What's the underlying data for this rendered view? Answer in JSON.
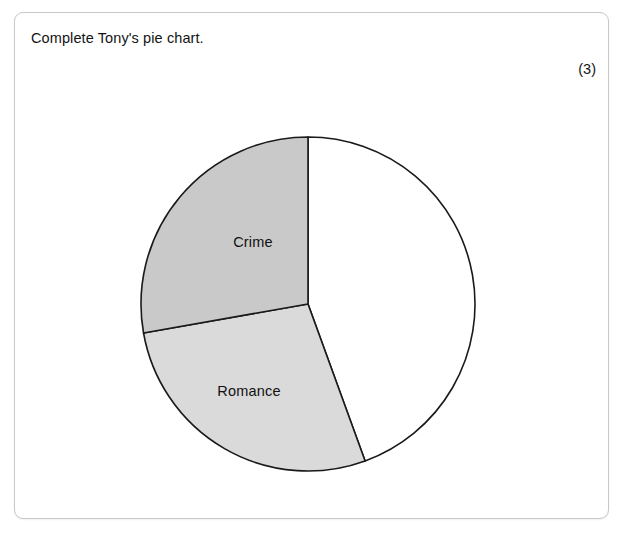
{
  "page": {
    "clipped_top_text": "",
    "prompt": "Complete Tony's pie chart.",
    "marks": "(3)"
  },
  "chart_data": {
    "type": "pie",
    "title": "",
    "labels": [
      "Crime",
      "Romance",
      ""
    ],
    "values": [
      100,
      100,
      160
    ],
    "value_unit": "degrees",
    "percentages": [
      27.8,
      27.8,
      44.4
    ],
    "colors": [
      "#c9c9c9",
      "#dadada",
      "#ffffff"
    ],
    "stroke_color": "#1a1a1a",
    "start_angle_deg": 0,
    "direction": "counterclockwise",
    "legend": "none",
    "grid": false,
    "annotations": [
      "Crime",
      "Romance"
    ],
    "slices": [
      {
        "label": "Crime",
        "angle_deg": 100,
        "start_deg": 0,
        "end_deg": 100,
        "color": "#c9c9c9",
        "label_shown": true
      },
      {
        "label": "Romance",
        "angle_deg": 100,
        "start_deg": 100,
        "end_deg": 200,
        "color": "#dadada",
        "label_shown": true
      },
      {
        "label": "",
        "angle_deg": 160,
        "start_deg": 200,
        "end_deg": 360,
        "color": "#ffffff",
        "label_shown": false
      }
    ],
    "geometry": {
      "center_x": 311,
      "center_y": 309,
      "radius": 167
    }
  }
}
